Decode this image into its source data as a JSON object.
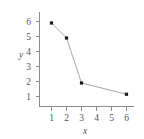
{
  "chart_data": {
    "type": "line",
    "title": "",
    "xlabel": "x",
    "ylabel": "y",
    "x": [
      1,
      2,
      3,
      6
    ],
    "values": [
      5.9,
      4.9,
      1.9,
      1.15
    ],
    "series": [
      {
        "name": "",
        "x": [
          1,
          2,
          3,
          6
        ],
        "values": [
          5.9,
          4.9,
          1.9,
          1.15
        ]
      }
    ],
    "xlim": [
      0.4,
      6.6
    ],
    "ylim": [
      0.2,
      6.6
    ],
    "xticks": [
      "1",
      "2",
      "3",
      "4",
      "5",
      "6"
    ],
    "yticks": [
      "1",
      "2",
      "3",
      "4",
      "5",
      "6"
    ],
    "grid": false,
    "legend": null,
    "marker": "square",
    "line_style": "solid"
  }
}
